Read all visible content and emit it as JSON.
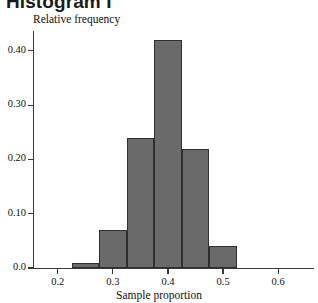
{
  "chart_data": {
    "type": "bar",
    "title": "Histogram I",
    "xlabel": "Sample proportion",
    "ylabel": "Relative frequency",
    "xlim": [
      0.155,
      0.665
    ],
    "ylim": [
      0.0,
      0.4365
    ],
    "grid": false,
    "legend": null,
    "bin_edges": [
      0.225,
      0.275,
      0.325,
      0.375,
      0.425,
      0.475,
      0.525
    ],
    "categories": [
      "0.225-0.275",
      "0.275-0.325",
      "0.325-0.375",
      "0.375-0.425",
      "0.425-0.475",
      "0.475-0.525"
    ],
    "values": [
      0.01,
      0.07,
      0.24,
      0.42,
      0.22,
      0.04
    ],
    "xticks": [
      {
        "value": 0.2,
        "label": "0.2"
      },
      {
        "value": 0.3,
        "label": "0.3"
      },
      {
        "value": 0.4,
        "label": "0.4"
      },
      {
        "value": 0.5,
        "label": "0.5"
      },
      {
        "value": 0.6,
        "label": "0.6"
      }
    ],
    "yticks": [
      {
        "value": 0.0,
        "label": "0.0"
      },
      {
        "value": 0.1,
        "label": "0.10"
      },
      {
        "value": 0.2,
        "label": "0.20"
      },
      {
        "value": 0.3,
        "label": "0.30"
      },
      {
        "value": 0.4,
        "label": "0.40"
      }
    ],
    "colors": {
      "bar_fill": "#6a6a6a",
      "bar_stroke": "#2f2f2f",
      "axis": "#3a3a3a",
      "text": "#111111",
      "title": "#1a1a1a",
      "background": "#ffffff"
    }
  }
}
